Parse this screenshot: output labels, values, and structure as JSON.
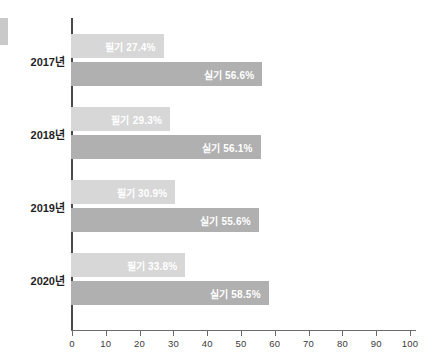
{
  "chart_data": {
    "type": "bar",
    "orientation": "horizontal",
    "title": "",
    "xlabel": "",
    "ylabel": "",
    "categories": [
      "2017년",
      "2018년",
      "2019년",
      "2020년"
    ],
    "series": [
      {
        "name": "필기",
        "color": "#d7d7d7",
        "values": [
          27.4,
          29.3,
          30.9,
          33.8
        ],
        "labels": [
          "필기 27.4%",
          "필기 29.3%",
          "필기 30.9%",
          "필기 33.8%"
        ]
      },
      {
        "name": "실기",
        "color": "#b0b0b0",
        "values": [
          56.6,
          56.1,
          55.6,
          58.5
        ],
        "labels": [
          "실기 56.6%",
          "실기 56.1%",
          "실기 55.6%",
          "실기 58.5%"
        ]
      }
    ],
    "xlim": [
      0,
      100
    ],
    "xticks": [
      0,
      10,
      20,
      30,
      40,
      50,
      60,
      70,
      80,
      90,
      100
    ],
    "xtick_labels": [
      "0",
      "10",
      "20",
      "30",
      "40",
      "50",
      "60",
      "70",
      "80",
      "90",
      "100"
    ],
    "grid": false,
    "legend": "none"
  }
}
